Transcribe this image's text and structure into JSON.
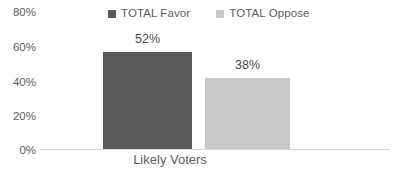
{
  "chart_data": {
    "type": "bar",
    "title": "",
    "xlabel": "",
    "ylabel": "",
    "categories": [
      "Likely Voters"
    ],
    "series": [
      {
        "name": "TOTAL Favor",
        "values": [
          52
        ],
        "color": "#595959"
      },
      {
        "name": "TOTAL Oppose",
        "values": [
          38
        ],
        "color": "#c8c8c8"
      }
    ],
    "value_labels": [
      "52%",
      "38%"
    ],
    "yticks": [
      0,
      20,
      40,
      60,
      80
    ],
    "ytick_labels": [
      "0%",
      "20%",
      "40%",
      "60%",
      "80%"
    ],
    "ylim": [
      0,
      80
    ],
    "grid": false,
    "legend_position": "top-center",
    "value_label_suffix": "%"
  },
  "legend": {
    "items": [
      {
        "label": "TOTAL Favor",
        "swatch_color": "#595959",
        "swatch_icon": "square-marker-icon"
      },
      {
        "label": "TOTAL Oppose",
        "swatch_color": "#c8c8c8",
        "swatch_icon": "square-marker-icon"
      }
    ]
  },
  "axis": {
    "y_labels": [
      "80%",
      "60%",
      "40%",
      "20%",
      "0%"
    ],
    "category_label": "Likely Voters",
    "axis_line_color": "#d6d6d6"
  },
  "bars": [
    {
      "series": "TOTAL Favor",
      "value": 52,
      "label": "52%",
      "color": "#595959"
    },
    {
      "series": "TOTAL Oppose",
      "value": 38,
      "label": "38%",
      "color": "#c8c8c8"
    }
  ],
  "colors": {
    "favor": "#595959",
    "oppose": "#c8c8c8",
    "text": "#5d5d5d",
    "background": "#ffffff"
  }
}
